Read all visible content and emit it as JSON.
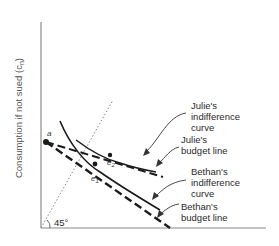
{
  "diagram": {
    "y_axis_label": "Consumption if not sued (c",
    "y_axis_label_sub": "n",
    "y_axis_label_close": ")",
    "angle_label": "45°",
    "points": {
      "a": "a",
      "e1": "e",
      "e1_sub": "1",
      "e2": "e",
      "e2_sub": "2"
    },
    "annotations": {
      "julie_ic": [
        "Julie's",
        "indifference",
        "curve"
      ],
      "julie_budget": [
        "Julie's",
        "budget line"
      ],
      "bethan_ic": [
        "Bethan's",
        "indifference",
        "curve"
      ],
      "bethan_budget": [
        "Bethan's",
        "budget line"
      ]
    },
    "colors": {
      "axis": "#7a7a7a",
      "line": "#1a1a1a",
      "dotted": "#777777",
      "text": "#2a2a2a"
    }
  }
}
